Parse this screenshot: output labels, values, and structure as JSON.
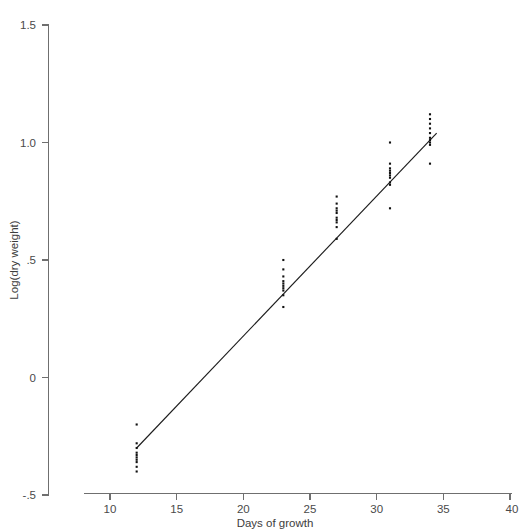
{
  "figure": {
    "caption_top": "",
    "background_color": "#ffffff",
    "axis_color": "#6f6f6f",
    "point_color": "#111111",
    "line_color": "#1c1c1c"
  },
  "chart_data": {
    "type": "scatter",
    "title": "",
    "xlabel": "Days of growth",
    "ylabel": "Log(dry weight)",
    "xlim": [
      8,
      40.2
    ],
    "ylim": [
      -0.5,
      1.5
    ],
    "xticks": [
      10,
      15,
      20,
      25,
      30,
      35,
      40
    ],
    "xtick_labels": [
      "10",
      "15",
      "20",
      "25",
      "30",
      "35",
      "40"
    ],
    "yticks": [
      -0.5,
      0,
      0.5,
      1.0,
      1.5
    ],
    "ytick_labels": [
      "-.5",
      "0",
      ".5",
      "1.0",
      "1.5"
    ],
    "grid": false,
    "legend": "none",
    "series": [
      {
        "name": "Log(dry weight) observations",
        "marker": "square-dot",
        "groups": [
          {
            "x": 12,
            "y": [
              -0.2,
              -0.28,
              -0.3,
              -0.32,
              -0.33,
              -0.34,
              -0.35,
              -0.36,
              -0.38,
              -0.4
            ]
          },
          {
            "x": 23,
            "y": [
              0.5,
              0.46,
              0.43,
              0.41,
              0.4,
              0.39,
              0.38,
              0.37,
              0.35,
              0.3
            ]
          },
          {
            "x": 27,
            "y": [
              0.77,
              0.74,
              0.72,
              0.71,
              0.7,
              0.68,
              0.67,
              0.66,
              0.64,
              0.59
            ]
          },
          {
            "x": 31,
            "y": [
              1.0,
              0.91,
              0.89,
              0.88,
              0.87,
              0.86,
              0.85,
              0.83,
              0.82,
              0.72
            ]
          },
          {
            "x": 34,
            "y": [
              1.12,
              1.1,
              1.08,
              1.06,
              1.04,
              1.02,
              1.01,
              1.0,
              0.99,
              0.91
            ]
          }
        ]
      }
    ],
    "fit_line": {
      "name": "fitted regression line",
      "x_start": 12,
      "y_start": -0.3,
      "x_end": 34.5,
      "y_end": 1.04,
      "slope": 0.0596,
      "intercept": -1.015
    },
    "annotations": []
  }
}
